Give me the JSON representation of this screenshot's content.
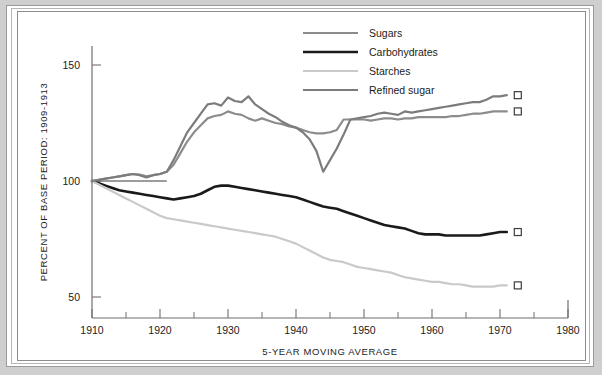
{
  "chart_data": {
    "type": "line",
    "title": "",
    "xlabel": "5-YEAR MOVING AVERAGE",
    "ylabel": "PERCENT OF BASE PERIOD: 1909-1913",
    "xlim": [
      1910,
      1980
    ],
    "ylim": [
      40,
      160
    ],
    "grid": false,
    "legend_position": "top-center",
    "x_ticks": [
      1910,
      1920,
      1930,
      1940,
      1950,
      1960,
      1970,
      1980
    ],
    "x_tick_labels": [
      "1910",
      "1920",
      "1930",
      "1940",
      "1950",
      "1960",
      "1970",
      "1980"
    ],
    "x_minor_ticks": [
      1915,
      1925,
      1935,
      1945,
      1955,
      1965,
      1975
    ],
    "y_ticks": [
      50,
      100,
      150
    ],
    "y_tick_labels": [
      "50",
      "100",
      "150"
    ],
    "reference_line": {
      "value": 100,
      "x_start": 1910,
      "x_end": 1921
    },
    "end_markers": [
      {
        "series": "Refined sugar",
        "x": 1971,
        "y": 137
      },
      {
        "series": "Sugars",
        "x": 1971,
        "y": 130
      },
      {
        "series": "Carbohydrates",
        "x": 1971,
        "y": 78
      },
      {
        "series": "Starches",
        "x": 1971,
        "y": 55
      }
    ],
    "x": [
      1910,
      1911,
      1912,
      1913,
      1914,
      1915,
      1916,
      1917,
      1918,
      1919,
      1920,
      1921,
      1922,
      1923,
      1924,
      1925,
      1926,
      1927,
      1928,
      1929,
      1930,
      1931,
      1932,
      1933,
      1934,
      1935,
      1936,
      1937,
      1938,
      1939,
      1940,
      1941,
      1942,
      1943,
      1944,
      1945,
      1946,
      1947,
      1948,
      1949,
      1950,
      1951,
      1952,
      1953,
      1954,
      1955,
      1956,
      1957,
      1958,
      1959,
      1960,
      1961,
      1962,
      1963,
      1964,
      1965,
      1966,
      1967,
      1968,
      1969,
      1970,
      1971
    ],
    "series": [
      {
        "name": "Sugars",
        "color": "#8c8c8c",
        "width": 2.2,
        "values": [
          100,
          100.5,
          101,
          101.5,
          102,
          102.5,
          103,
          102.8,
          102,
          102.5,
          103,
          104,
          107,
          112,
          117,
          121,
          124,
          127,
          128,
          128.5,
          130,
          129,
          128.5,
          127,
          126,
          127,
          126,
          125,
          124.5,
          123.5,
          123,
          122,
          121,
          120.5,
          120.5,
          121,
          122,
          126.5,
          126.5,
          126.5,
          126.5,
          126,
          126.5,
          127,
          127,
          126.5,
          127,
          127,
          127.5,
          127.5,
          127.5,
          127.5,
          127.5,
          128,
          128,
          128.5,
          129,
          129,
          129.5,
          130,
          130,
          130
        ]
      },
      {
        "name": "Carbohydrates",
        "color": "#1a1a1a",
        "width": 2.6,
        "values": [
          100,
          99,
          98,
          97,
          96,
          95.5,
          95,
          94.5,
          94,
          93.5,
          93,
          92.5,
          92,
          92.5,
          93,
          93.5,
          94.5,
          96,
          97.5,
          98,
          98,
          97.5,
          97,
          96.5,
          96,
          95.5,
          95,
          94.5,
          94,
          93.5,
          93,
          92,
          91,
          90,
          89,
          88.5,
          88,
          87,
          86,
          85,
          84,
          83,
          82,
          81,
          80.5,
          80,
          79.5,
          78.5,
          77.5,
          77,
          77,
          77,
          76.5,
          76.5,
          76.5,
          76.5,
          76.5,
          76.5,
          77,
          77.5,
          78,
          78
        ]
      },
      {
        "name": "Starches",
        "color": "#c9c9c9",
        "width": 2.2,
        "values": [
          100,
          98.5,
          97,
          95.5,
          94,
          92.5,
          91,
          89.5,
          88,
          86.5,
          85,
          84,
          83.5,
          83,
          82.5,
          82,
          81.5,
          81,
          80.5,
          80,
          79.5,
          79,
          78.5,
          78,
          77.5,
          77,
          76.5,
          76,
          75,
          74,
          73,
          71.5,
          70,
          68.5,
          67,
          66,
          65.5,
          65,
          64,
          63,
          62.5,
          62,
          61.5,
          61,
          60.5,
          59.5,
          58.5,
          58,
          57.5,
          57,
          56.5,
          56.5,
          56,
          55.5,
          55.5,
          55,
          54.5,
          54.5,
          54.5,
          54.5,
          55,
          55
        ]
      },
      {
        "name": "Refined sugar",
        "color": "#7c7c7c",
        "width": 2.2,
        "values": [
          100,
          100.5,
          101,
          101.5,
          102,
          102.5,
          103,
          102.5,
          101.5,
          102.5,
          103,
          104,
          109,
          115,
          121,
          125,
          129,
          133,
          133.5,
          132.5,
          136,
          134.5,
          134,
          136.5,
          133,
          131,
          129,
          127.5,
          125.5,
          124,
          123,
          121,
          118,
          113,
          104,
          109,
          114,
          120,
          126.5,
          127,
          127.5,
          128,
          129,
          129.5,
          129,
          128.5,
          130,
          129.5,
          130,
          130.5,
          131,
          131.5,
          132,
          132.5,
          133,
          133.5,
          134,
          134,
          135,
          136.5,
          136.5,
          137
        ]
      }
    ],
    "legend": [
      {
        "label": "Sugars",
        "color": "#8c8c8c"
      },
      {
        "label": "Carbohydrates",
        "color": "#1a1a1a"
      },
      {
        "label": "Starches",
        "color": "#c9c9c9"
      },
      {
        "label": "Refined sugar",
        "color": "#7c7c7c"
      }
    ]
  }
}
